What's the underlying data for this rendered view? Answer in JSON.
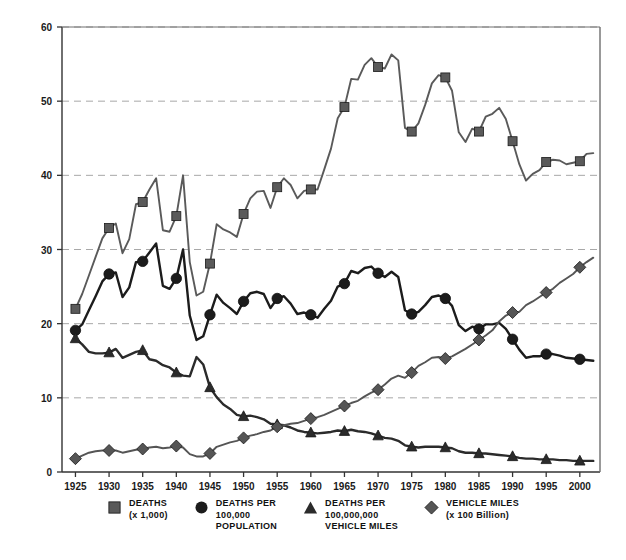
{
  "chart_data": {
    "type": "line",
    "title": "",
    "subtitle": "",
    "xlabel": "",
    "ylabel": "",
    "xlim": [
      1923,
      2003
    ],
    "ylim": [
      0,
      60
    ],
    "yticks": [
      0,
      10,
      20,
      30,
      40,
      50,
      60
    ],
    "xticks": [
      1925,
      1930,
      1935,
      1940,
      1945,
      1950,
      1955,
      1960,
      1965,
      1970,
      1975,
      1980,
      1985,
      1990,
      1995,
      2000
    ],
    "grid": "horizontal-dashed",
    "legend_position": "bottom",
    "x": [
      1925,
      1926,
      1927,
      1928,
      1929,
      1930,
      1931,
      1932,
      1933,
      1934,
      1935,
      1936,
      1937,
      1938,
      1939,
      1940,
      1941,
      1942,
      1943,
      1944,
      1945,
      1946,
      1947,
      1948,
      1949,
      1950,
      1951,
      1952,
      1953,
      1954,
      1955,
      1956,
      1957,
      1958,
      1959,
      1960,
      1961,
      1962,
      1963,
      1964,
      1965,
      1966,
      1967,
      1968,
      1969,
      1970,
      1971,
      1972,
      1973,
      1974,
      1975,
      1976,
      1977,
      1978,
      1979,
      1980,
      1981,
      1982,
      1983,
      1984,
      1985,
      1986,
      1987,
      1988,
      1989,
      1990,
      1991,
      1992,
      1993,
      1994,
      1995,
      1996,
      1997,
      1998,
      1999,
      2000,
      2001,
      2002
    ],
    "series": [
      {
        "name": "DEATHS (x 1,000)",
        "marker": "square",
        "color": "#5a5a5a",
        "marker_years": [
          1925,
          1930,
          1935,
          1940,
          1945,
          1950,
          1955,
          1960,
          1965,
          1970,
          1975,
          1980,
          1985,
          1990,
          1995,
          2000
        ],
        "values": [
          22.0,
          24.0,
          26.5,
          29.0,
          31.5,
          32.9,
          33.5,
          29.5,
          31.4,
          36.1,
          36.4,
          38.1,
          39.6,
          32.6,
          32.4,
          34.5,
          40.0,
          28.3,
          23.8,
          24.3,
          28.1,
          33.4,
          32.7,
          32.3,
          31.7,
          34.8,
          36.9,
          37.8,
          37.9,
          35.6,
          38.4,
          39.6,
          38.7,
          36.9,
          37.9,
          38.1,
          38.1,
          40.8,
          43.6,
          47.7,
          49.2,
          53.0,
          52.9,
          54.9,
          55.8,
          54.6,
          54.4,
          56.3,
          55.5,
          46.4,
          45.9,
          47.0,
          49.5,
          52.4,
          53.5,
          53.2,
          51.4,
          45.8,
          44.5,
          46.3,
          45.9,
          47.9,
          48.3,
          49.1,
          47.6,
          44.6,
          41.5,
          39.3,
          40.2,
          40.7,
          41.8,
          42.1,
          42.0,
          41.5,
          41.7,
          41.9,
          42.9,
          43.0
        ]
      },
      {
        "name": "DEATHS PER 100,000 POPULATION",
        "marker": "circle",
        "color": "#1c1c1c",
        "marker_years": [
          1925,
          1930,
          1935,
          1940,
          1945,
          1950,
          1955,
          1960,
          1965,
          1970,
          1975,
          1980,
          1985,
          1990,
          1995,
          2000
        ],
        "values": [
          19.1,
          19.9,
          21.8,
          23.7,
          25.7,
          26.7,
          26.9,
          23.6,
          24.9,
          28.3,
          28.4,
          29.6,
          30.8,
          25.1,
          24.7,
          26.1,
          30.0,
          21.1,
          17.8,
          18.3,
          21.2,
          23.9,
          22.8,
          22.1,
          21.3,
          23.0,
          24.1,
          24.3,
          24.0,
          22.1,
          23.4,
          23.7,
          22.7,
          21.3,
          21.5,
          21.2,
          20.8,
          22.0,
          23.1,
          25.0,
          25.4,
          27.1,
          26.8,
          27.5,
          27.7,
          26.8,
          26.3,
          27.0,
          26.3,
          21.8,
          21.3,
          21.6,
          22.5,
          23.6,
          23.8,
          23.4,
          22.4,
          19.8,
          19.0,
          19.6,
          19.3,
          19.9,
          19.9,
          20.1,
          19.3,
          17.9,
          16.5,
          15.4,
          15.6,
          15.6,
          15.9,
          15.9,
          15.7,
          15.4,
          15.3,
          15.2,
          15.1,
          15.0
        ]
      },
      {
        "name": "DEATHS PER 100,000,000 VEHICLE MILES",
        "marker": "triangle",
        "color": "#2b2b2b",
        "marker_years": [
          1925,
          1930,
          1935,
          1940,
          1945,
          1950,
          1955,
          1960,
          1965,
          1970,
          1975,
          1980,
          1985,
          1990,
          1995,
          2000
        ],
        "values": [
          18.0,
          17.2,
          16.2,
          16.0,
          16.0,
          16.1,
          16.6,
          15.4,
          15.8,
          16.2,
          16.4,
          15.2,
          15.0,
          14.4,
          14.1,
          13.4,
          13.0,
          12.9,
          15.5,
          14.5,
          11.4,
          10.1,
          9.1,
          8.5,
          7.7,
          7.5,
          7.6,
          7.4,
          7.1,
          6.5,
          6.4,
          6.3,
          6.0,
          5.6,
          5.4,
          5.3,
          5.2,
          5.3,
          5.4,
          5.6,
          5.5,
          5.7,
          5.5,
          5.4,
          5.2,
          4.9,
          4.6,
          4.5,
          4.2,
          3.6,
          3.4,
          3.3,
          3.4,
          3.4,
          3.4,
          3.3,
          3.2,
          2.8,
          2.6,
          2.6,
          2.5,
          2.5,
          2.4,
          2.3,
          2.2,
          2.1,
          1.9,
          1.8,
          1.8,
          1.7,
          1.7,
          1.7,
          1.6,
          1.6,
          1.5,
          1.5,
          1.5,
          1.5
        ]
      },
      {
        "name": "VEHICLE MILES (x 100 Billion)",
        "marker": "diamond",
        "color": "#555555",
        "marker_years": [
          1925,
          1930,
          1935,
          1940,
          1945,
          1950,
          1955,
          1960,
          1965,
          1970,
          1975,
          1980,
          1985,
          1990,
          1995,
          2000
        ],
        "values": [
          1.8,
          2.2,
          2.6,
          2.8,
          2.9,
          2.9,
          2.9,
          2.6,
          2.8,
          3.0,
          3.1,
          3.3,
          3.4,
          3.2,
          3.3,
          3.5,
          3.3,
          2.4,
          2.1,
          2.1,
          2.5,
          3.4,
          3.7,
          4.0,
          4.2,
          4.6,
          4.9,
          5.1,
          5.4,
          5.6,
          6.1,
          6.3,
          6.5,
          6.6,
          6.9,
          7.2,
          7.4,
          7.7,
          8.1,
          8.5,
          8.9,
          9.3,
          9.6,
          10.2,
          10.7,
          11.1,
          11.8,
          12.6,
          13.0,
          12.7,
          13.4,
          14.3,
          14.8,
          15.4,
          15.5,
          15.3,
          15.6,
          16.1,
          16.6,
          17.2,
          17.8,
          18.4,
          19.1,
          20.3,
          21.1,
          21.5,
          21.6,
          22.5,
          23.0,
          23.6,
          24.2,
          24.7,
          25.5,
          26.1,
          26.7,
          27.6,
          28.3,
          28.9
        ]
      }
    ]
  },
  "legend": [
    {
      "marker": "square",
      "line1": "DEATHS",
      "line2": "(x 1,000)",
      "line3": "",
      "color": "#5a5a5a"
    },
    {
      "marker": "circle",
      "line1": "DEATHS PER",
      "line2": "100,000",
      "line3": "POPULATION",
      "color": "#1c1c1c"
    },
    {
      "marker": "triangle",
      "line1": "DEATHS PER",
      "line2": "100,000,000",
      "line3": "VEHICLE MILES",
      "color": "#2b2b2b"
    },
    {
      "marker": "diamond",
      "line1": "VEHICLE MILES",
      "line2": "(x 100 Billion)",
      "line3": "",
      "color": "#555555"
    }
  ],
  "axis": {
    "y_labels": [
      "0",
      "10",
      "20",
      "30",
      "40",
      "50",
      "60"
    ],
    "x_labels": [
      "1925",
      "1930",
      "1935",
      "1940",
      "1945",
      "1950",
      "1955",
      "1960",
      "1965",
      "1970",
      "1975",
      "1980",
      "1985",
      "1990",
      "1995",
      "2000"
    ]
  }
}
